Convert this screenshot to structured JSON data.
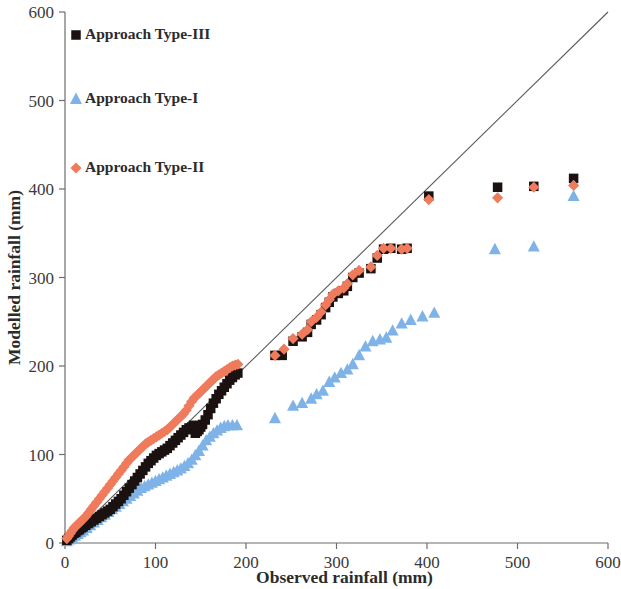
{
  "chart_data": {
    "type": "scatter",
    "title": "",
    "xlabel": "Observed rainfall (mm)",
    "ylabel": "Modelled rainfall (mm)",
    "xlim": [
      0,
      600
    ],
    "ylim": [
      0,
      600
    ],
    "xticks": [
      0,
      100,
      200,
      300,
      400,
      500,
      600
    ],
    "yticks": [
      0,
      100,
      200,
      300,
      400,
      500,
      600
    ],
    "xticklabels": [
      "0",
      "100",
      "200",
      "300",
      "400",
      "500",
      "600"
    ],
    "yticklabels": [
      "0",
      "100",
      "200",
      "300",
      "400",
      "500",
      "600"
    ],
    "grid": false,
    "legend_position": "top-left",
    "reference_line": {
      "name": "1:1 line",
      "from": [
        0,
        0
      ],
      "to": [
        600,
        600
      ],
      "color": "#5a5a5a"
    },
    "series": [
      {
        "name": "Approach Type-III",
        "marker": "square",
        "color": "#1a1110",
        "points": [
          [
            2,
            3
          ],
          [
            4,
            5
          ],
          [
            6,
            7
          ],
          [
            8,
            9
          ],
          [
            10,
            11
          ],
          [
            12,
            12
          ],
          [
            14,
            14
          ],
          [
            16,
            15
          ],
          [
            18,
            17
          ],
          [
            20,
            18
          ],
          [
            23,
            20
          ],
          [
            26,
            22
          ],
          [
            29,
            24
          ],
          [
            32,
            26
          ],
          [
            35,
            28
          ],
          [
            38,
            30
          ],
          [
            41,
            32
          ],
          [
            44,
            34
          ],
          [
            47,
            36
          ],
          [
            50,
            38
          ],
          [
            53,
            41
          ],
          [
            56,
            44
          ],
          [
            59,
            47
          ],
          [
            62,
            50
          ],
          [
            65,
            54
          ],
          [
            68,
            58
          ],
          [
            71,
            62
          ],
          [
            74,
            66
          ],
          [
            77,
            70
          ],
          [
            80,
            74
          ],
          [
            83,
            78
          ],
          [
            86,
            82
          ],
          [
            89,
            86
          ],
          [
            92,
            90
          ],
          [
            95,
            93
          ],
          [
            98,
            96
          ],
          [
            101,
            99
          ],
          [
            104,
            101
          ],
          [
            107,
            103
          ],
          [
            110,
            105
          ],
          [
            113,
            107
          ],
          [
            116,
            110
          ],
          [
            119,
            113
          ],
          [
            122,
            116
          ],
          [
            125,
            119
          ],
          [
            128,
            122
          ],
          [
            131,
            125
          ],
          [
            134,
            128
          ],
          [
            137,
            130
          ],
          [
            140,
            131
          ],
          [
            142,
            133
          ],
          [
            144,
            124
          ],
          [
            146,
            126
          ],
          [
            148,
            128
          ],
          [
            150,
            131
          ],
          [
            152,
            134
          ],
          [
            155,
            139
          ],
          [
            158,
            145
          ],
          [
            161,
            152
          ],
          [
            164,
            158
          ],
          [
            167,
            163
          ],
          [
            170,
            168
          ],
          [
            173,
            172
          ],
          [
            176,
            176
          ],
          [
            179,
            180
          ],
          [
            182,
            184
          ],
          [
            185,
            187
          ],
          [
            188,
            190
          ],
          [
            191,
            192
          ],
          [
            232,
            212
          ],
          [
            240,
            212
          ],
          [
            252,
            228
          ],
          [
            262,
            233
          ],
          [
            268,
            238
          ],
          [
            272,
            247
          ],
          [
            278,
            252
          ],
          [
            283,
            258
          ],
          [
            288,
            266
          ],
          [
            292,
            272
          ],
          [
            296,
            278
          ],
          [
            302,
            282
          ],
          [
            308,
            285
          ],
          [
            312,
            290
          ],
          [
            318,
            300
          ],
          [
            325,
            305
          ],
          [
            338,
            310
          ],
          [
            345,
            322
          ],
          [
            352,
            332
          ],
          [
            360,
            333
          ],
          [
            372,
            332
          ],
          [
            378,
            333
          ],
          [
            402,
            392
          ],
          [
            478,
            402
          ],
          [
            518,
            403
          ],
          [
            562,
            412
          ]
        ]
      },
      {
        "name": "Approach Type-I",
        "marker": "triangle",
        "color": "#7fb3e8",
        "points": [
          [
            2,
            2
          ],
          [
            5,
            4
          ],
          [
            8,
            6
          ],
          [
            11,
            8
          ],
          [
            14,
            10
          ],
          [
            17,
            12
          ],
          [
            20,
            14
          ],
          [
            24,
            17
          ],
          [
            28,
            20
          ],
          [
            32,
            23
          ],
          [
            36,
            26
          ],
          [
            40,
            29
          ],
          [
            44,
            32
          ],
          [
            48,
            35
          ],
          [
            52,
            38
          ],
          [
            56,
            41
          ],
          [
            60,
            44
          ],
          [
            64,
            47
          ],
          [
            68,
            50
          ],
          [
            72,
            53
          ],
          [
            76,
            56
          ],
          [
            80,
            59
          ],
          [
            84,
            62
          ],
          [
            88,
            64
          ],
          [
            92,
            66
          ],
          [
            96,
            68
          ],
          [
            100,
            70
          ],
          [
            104,
            72
          ],
          [
            108,
            74
          ],
          [
            112,
            76
          ],
          [
            116,
            78
          ],
          [
            120,
            80
          ],
          [
            124,
            82
          ],
          [
            128,
            84
          ],
          [
            132,
            87
          ],
          [
            136,
            90
          ],
          [
            140,
            94
          ],
          [
            144,
            99
          ],
          [
            148,
            104
          ],
          [
            152,
            110
          ],
          [
            156,
            116
          ],
          [
            160,
            120
          ],
          [
            164,
            124
          ],
          [
            168,
            127
          ],
          [
            172,
            130
          ],
          [
            176,
            132
          ],
          [
            180,
            133
          ],
          [
            185,
            133
          ],
          [
            190,
            133
          ],
          [
            232,
            141
          ],
          [
            252,
            155
          ],
          [
            262,
            158
          ],
          [
            272,
            163
          ],
          [
            278,
            168
          ],
          [
            285,
            172
          ],
          [
            292,
            182
          ],
          [
            298,
            187
          ],
          [
            305,
            192
          ],
          [
            312,
            196
          ],
          [
            318,
            202
          ],
          [
            325,
            212
          ],
          [
            332,
            222
          ],
          [
            340,
            228
          ],
          [
            348,
            230
          ],
          [
            355,
            232
          ],
          [
            362,
            240
          ],
          [
            372,
            248
          ],
          [
            382,
            252
          ],
          [
            395,
            256
          ],
          [
            408,
            260
          ],
          [
            475,
            332
          ],
          [
            518,
            335
          ],
          [
            562,
            392
          ]
        ]
      },
      {
        "name": "Approach Type-II",
        "marker": "diamond",
        "color": "#ef7b5c",
        "points": [
          [
            2,
            5
          ],
          [
            4,
            8
          ],
          [
            6,
            11
          ],
          [
            8,
            14
          ],
          [
            10,
            17
          ],
          [
            12,
            19
          ],
          [
            14,
            21
          ],
          [
            16,
            23
          ],
          [
            18,
            25
          ],
          [
            20,
            27
          ],
          [
            23,
            30
          ],
          [
            26,
            34
          ],
          [
            29,
            38
          ],
          [
            32,
            42
          ],
          [
            35,
            46
          ],
          [
            38,
            50
          ],
          [
            41,
            54
          ],
          [
            44,
            58
          ],
          [
            47,
            62
          ],
          [
            50,
            66
          ],
          [
            53,
            70
          ],
          [
            56,
            74
          ],
          [
            59,
            78
          ],
          [
            62,
            82
          ],
          [
            65,
            86
          ],
          [
            68,
            90
          ],
          [
            71,
            94
          ],
          [
            74,
            97
          ],
          [
            77,
            100
          ],
          [
            80,
            103
          ],
          [
            83,
            106
          ],
          [
            86,
            109
          ],
          [
            89,
            112
          ],
          [
            92,
            114
          ],
          [
            95,
            116
          ],
          [
            98,
            118
          ],
          [
            101,
            120
          ],
          [
            104,
            122
          ],
          [
            107,
            124
          ],
          [
            110,
            126
          ],
          [
            113,
            128
          ],
          [
            116,
            131
          ],
          [
            119,
            134
          ],
          [
            122,
            137
          ],
          [
            125,
            140
          ],
          [
            128,
            143
          ],
          [
            131,
            146
          ],
          [
            134,
            150
          ],
          [
            137,
            155
          ],
          [
            140,
            160
          ],
          [
            143,
            164
          ],
          [
            146,
            167
          ],
          [
            149,
            170
          ],
          [
            152,
            173
          ],
          [
            155,
            176
          ],
          [
            158,
            179
          ],
          [
            161,
            182
          ],
          [
            164,
            185
          ],
          [
            167,
            188
          ],
          [
            170,
            190
          ],
          [
            173,
            192
          ],
          [
            176,
            194
          ],
          [
            179,
            196
          ],
          [
            182,
            198
          ],
          [
            185,
            200
          ],
          [
            188,
            201
          ],
          [
            191,
            202
          ],
          [
            232,
            212
          ],
          [
            242,
            219
          ],
          [
            252,
            231
          ],
          [
            262,
            236
          ],
          [
            268,
            241
          ],
          [
            272,
            250
          ],
          [
            278,
            255
          ],
          [
            283,
            261
          ],
          [
            288,
            269
          ],
          [
            292,
            275
          ],
          [
            296,
            281
          ],
          [
            302,
            285
          ],
          [
            308,
            288
          ],
          [
            312,
            293
          ],
          [
            318,
            303
          ],
          [
            325,
            308
          ],
          [
            338,
            312
          ],
          [
            345,
            325
          ],
          [
            352,
            333
          ],
          [
            360,
            333
          ],
          [
            372,
            332
          ],
          [
            378,
            333
          ],
          [
            402,
            388
          ],
          [
            478,
            390
          ],
          [
            518,
            402
          ],
          [
            562,
            404
          ]
        ]
      }
    ]
  },
  "legend": {
    "items": [
      {
        "label": "Approach Type-III",
        "marker": "square",
        "color": "#1a1110"
      },
      {
        "label": "Approach Type-I",
        "marker": "triangle",
        "color": "#7fb3e8"
      },
      {
        "label": "Approach Type-II",
        "marker": "diamond",
        "color": "#ef7b5c"
      }
    ]
  }
}
